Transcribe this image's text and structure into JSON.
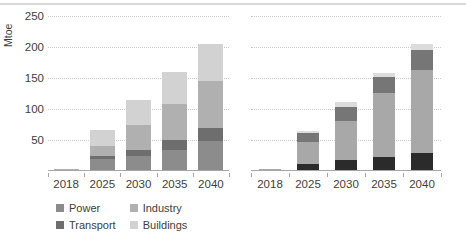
{
  "figure": {
    "top_rule_color": "#d9d9d9",
    "grid_color": "#c9c9c9",
    "axis_color": "#a6a6a6",
    "text_color": "#3d3d3d"
  },
  "charts": [
    {
      "id": "chart-by-sector",
      "ylabel": "Mtoe",
      "yticks": [
        "50",
        "100",
        "150",
        "200",
        "250"
      ],
      "xlabels": [
        "2018",
        "2025",
        "2030",
        "2035",
        "2040"
      ],
      "legend": [
        {
          "label": "Power",
          "color": "#8c8c8c"
        },
        {
          "label": "Industry",
          "color": "#b0b0b0"
        },
        {
          "label": "Transport",
          "color": "#6e6e6e"
        },
        {
          "label": "Buildings",
          "color": "#d2d2d2"
        }
      ]
    },
    {
      "id": "chart-by-region",
      "ylabel": "",
      "yticks": [
        "50",
        "100",
        "150",
        "200",
        "250"
      ],
      "xlabels": [
        "2018",
        "2025",
        "2030",
        "2035",
        "2040"
      ],
      "legend": [
        {
          "label": "North America",
          "color": "#2b2b2b"
        },
        {
          "label": "Asia Pacific",
          "color": "#767676"
        },
        {
          "label": "Europe",
          "color": "#a8a8a8"
        },
        {
          "label": "Rest of world",
          "color": "#dcdcdc"
        }
      ]
    }
  ],
  "chart_data": [
    {
      "type": "bar",
      "id": "chart-by-sector",
      "subtype": "stacked",
      "title": "",
      "xlabel": "",
      "ylabel": "Mtoe",
      "ylim": [
        0,
        250
      ],
      "yticks": [
        50,
        100,
        150,
        200,
        250
      ],
      "grid": true,
      "legend_position": "bottom",
      "categories": [
        "2018",
        "2025",
        "2030",
        "2035",
        "2040"
      ],
      "series": [
        {
          "name": "Power",
          "color": "#8c8c8c",
          "values": [
            1,
            17,
            23,
            33,
            46
          ]
        },
        {
          "name": "Transport",
          "color": "#6e6e6e",
          "values": [
            0,
            6,
            10,
            16,
            22
          ]
        },
        {
          "name": "Industry",
          "color": "#b0b0b0",
          "values": [
            1,
            16,
            39,
            58,
            76
          ]
        },
        {
          "name": "Buildings",
          "color": "#d2d2d2",
          "values": [
            0,
            26,
            41,
            51,
            60
          ]
        }
      ],
      "stack_order_bottom_to_top": [
        "Power",
        "Transport",
        "Industry",
        "Buildings"
      ],
      "totals": [
        2,
        65,
        113,
        158,
        204
      ]
    },
    {
      "type": "bar",
      "id": "chart-by-region",
      "subtype": "stacked",
      "title": "",
      "xlabel": "",
      "ylabel": "",
      "ylim": [
        0,
        250
      ],
      "yticks": [
        50,
        100,
        150,
        200,
        250
      ],
      "grid": true,
      "legend_position": "bottom",
      "categories": [
        "2018",
        "2025",
        "2030",
        "2035",
        "2040"
      ],
      "series": [
        {
          "name": "North America",
          "color": "#2b2b2b",
          "values": [
            1,
            10,
            16,
            21,
            27
          ]
        },
        {
          "name": "Europe",
          "color": "#a8a8a8",
          "values": [
            1,
            35,
            63,
            103,
            135
          ]
        },
        {
          "name": "Asia Pacific",
          "color": "#767676",
          "values": [
            0,
            14,
            23,
            26,
            32
          ]
        },
        {
          "name": "Rest of world",
          "color": "#dcdcdc",
          "values": [
            0,
            4,
            8,
            7,
            9
          ]
        }
      ],
      "stack_order_bottom_to_top": [
        "North America",
        "Europe",
        "Asia Pacific",
        "Rest of world"
      ],
      "totals": [
        2,
        63,
        110,
        157,
        203
      ]
    }
  ]
}
